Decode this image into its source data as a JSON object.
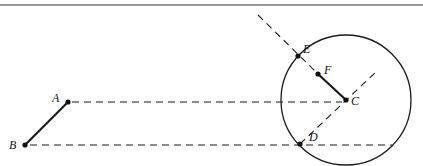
{
  "diagram": {
    "type": "geometry-construction",
    "colors": {
      "stroke": "#1a1a1a",
      "rule": "#7a7a7a",
      "background": "#ffffff"
    },
    "points": [
      {
        "id": "A",
        "label": "A",
        "x": 68,
        "y": 102,
        "label_dx": -16,
        "label_dy": 0
      },
      {
        "id": "B",
        "label": "B",
        "x": 25,
        "y": 145,
        "label_dx": -16,
        "label_dy": 4
      },
      {
        "id": "C",
        "label": "C",
        "x": 346,
        "y": 100,
        "label_dx": 5,
        "label_dy": 5
      },
      {
        "id": "D",
        "label": "D",
        "x": 300,
        "y": 144,
        "label_dx": 9,
        "label_dy": -3
      },
      {
        "id": "E",
        "label": "E",
        "x": 298,
        "y": 56,
        "label_dx": 5,
        "label_dy": -3
      },
      {
        "id": "F",
        "label": "F",
        "x": 318,
        "y": 74,
        "label_dx": 6,
        "label_dy": 0
      }
    ],
    "circle": {
      "center": "C",
      "cx": 346,
      "cy": 100,
      "r": 65
    },
    "solid_segments": [
      {
        "from": "A",
        "to": "B"
      },
      {
        "from": "F",
        "to": "C"
      }
    ],
    "dashed_lines": [
      {
        "name": "A-to-C-horizontal",
        "x1": 72,
        "y1": 102,
        "x2": 342,
        "y2": 102
      },
      {
        "name": "B-to-D-horizontal",
        "x1": 30,
        "y1": 145,
        "x2": 392,
        "y2": 145
      },
      {
        "name": "line-through-E-F-C",
        "x1": 258,
        "y1": 15,
        "x2": 318,
        "y2": 74
      },
      {
        "name": "line-through-D-C",
        "x1": 300,
        "y1": 144,
        "x2": 378,
        "y2": 70
      }
    ]
  },
  "labels": {
    "A": "A",
    "B": "B",
    "C": "C",
    "D": "D",
    "E": "E",
    "F": "F"
  }
}
